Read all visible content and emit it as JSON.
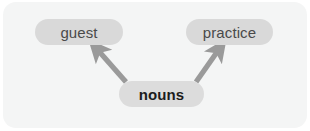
{
  "diagram": {
    "type": "concept-map",
    "background_color": "#ffffff",
    "panel_color": "#f4f5f5",
    "node_fill_color": "#d9d9d9",
    "node_text_color": "#4a4a4a",
    "root_node_text_color": "#1c1c1c",
    "edge_color": "#9a9a9a",
    "nodes": [
      {
        "id": "guest",
        "label": "guest",
        "emphasis": "normal"
      },
      {
        "id": "practice",
        "label": "practice",
        "emphasis": "normal"
      },
      {
        "id": "nouns",
        "label": "nouns",
        "emphasis": "bold"
      }
    ],
    "edges": [
      {
        "from": "nouns",
        "to": "guest",
        "direction": "up-left",
        "style": "solid-arrow"
      },
      {
        "from": "nouns",
        "to": "practice",
        "direction": "up-right",
        "style": "solid-arrow"
      }
    ]
  }
}
